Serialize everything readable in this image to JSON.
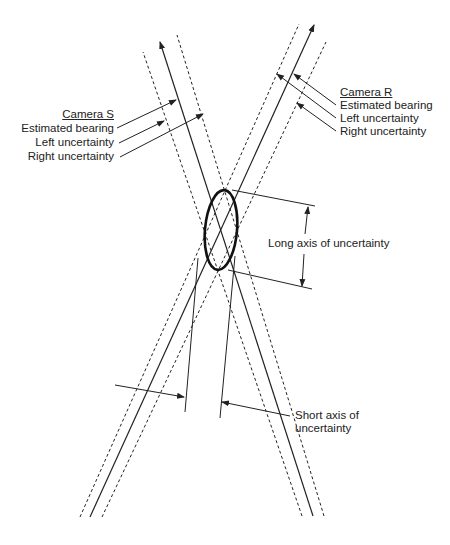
{
  "camera_s": {
    "title": "Camera S",
    "estimated_bearing": "Estimated bearing",
    "left_uncertainty": "Left uncertainty",
    "right_uncertainty": "Right uncertainty"
  },
  "camera_r": {
    "title": "Camera R",
    "estimated_bearing": "Estimated bearing",
    "left_uncertainty": "Left uncertainty",
    "right_uncertainty": "Right uncertainty"
  },
  "long_axis_label": "Long axis of uncertainty",
  "short_axis_label_line1": "Short axis of",
  "short_axis_label_line2": "uncertainty",
  "colors": {
    "line": "#222222",
    "background": "#ffffff"
  }
}
